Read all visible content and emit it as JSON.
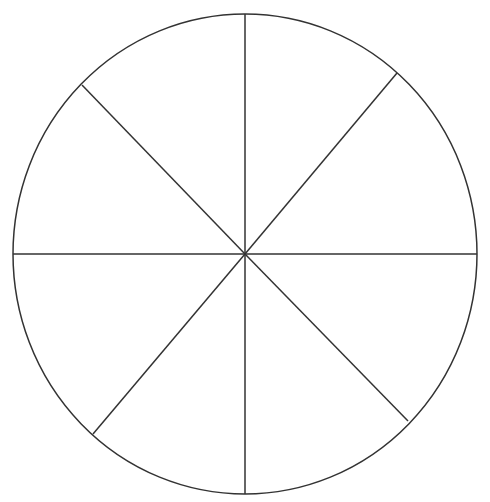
{
  "diagram": {
    "type": "segmented-circle",
    "segment_count": 8,
    "background_color": "#ffffff",
    "stroke_color": "#333333",
    "stroke_width": 1.5,
    "circle": {
      "cx": 245,
      "cy": 254,
      "rx": 232,
      "ry": 240
    },
    "spokes": [
      {
        "name": "spoke-top",
        "x2": 245,
        "y2": 14
      },
      {
        "name": "spoke-top-right",
        "x2": 397,
        "y2": 73
      },
      {
        "name": "spoke-right",
        "x2": 477,
        "y2": 254
      },
      {
        "name": "spoke-bottom-right",
        "x2": 408,
        "y2": 421
      },
      {
        "name": "spoke-bottom",
        "x2": 245,
        "y2": 494
      },
      {
        "name": "spoke-bottom-left",
        "x2": 93,
        "y2": 434
      },
      {
        "name": "spoke-left",
        "x2": 13,
        "y2": 254
      },
      {
        "name": "spoke-top-left",
        "x2": 82,
        "y2": 85
      }
    ]
  }
}
